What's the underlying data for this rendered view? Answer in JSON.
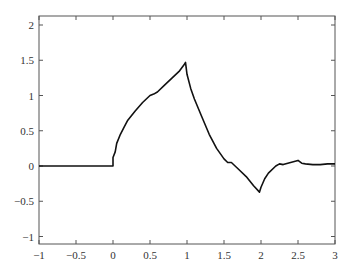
{
  "chart_data": {
    "type": "line",
    "title": "",
    "xlabel": "",
    "ylabel": "",
    "xlim": [
      -1,
      3
    ],
    "ylim": [
      -1.1,
      2.1
    ],
    "grid": false,
    "legend": null,
    "xticks": [
      "-1",
      "-0.5",
      "0",
      "0.5",
      "1",
      "1.5",
      "2",
      "2.5",
      "3"
    ],
    "yticks": [
      "-1",
      "-0.5",
      "0",
      "0.5",
      "1",
      "1.5",
      "2"
    ],
    "series": [
      {
        "name": "signal",
        "color": "#111111",
        "x": [
          -1,
          0,
          0.0,
          0.03,
          0.05,
          0.1,
          0.15,
          0.2,
          0.3,
          0.4,
          0.5,
          0.55,
          0.6,
          0.7,
          0.8,
          0.9,
          0.97,
          0.98,
          1.0,
          1.05,
          1.1,
          1.2,
          1.3,
          1.4,
          1.5,
          1.55,
          1.6,
          1.7,
          1.8,
          1.9,
          1.98,
          2.0,
          2.05,
          2.1,
          2.2,
          2.25,
          2.3,
          2.4,
          2.5,
          2.55,
          2.6,
          2.7,
          2.8,
          2.9,
          3.0
        ],
        "y": [
          0,
          0,
          0.12,
          0.2,
          0.32,
          0.45,
          0.55,
          0.65,
          0.78,
          0.9,
          1.0,
          1.02,
          1.05,
          1.15,
          1.25,
          1.35,
          1.45,
          1.47,
          1.3,
          1.1,
          0.95,
          0.7,
          0.45,
          0.25,
          0.1,
          0.05,
          0.05,
          -0.05,
          -0.15,
          -0.28,
          -0.37,
          -0.3,
          -0.18,
          -0.1,
          0.0,
          0.03,
          0.02,
          0.05,
          0.08,
          0.04,
          0.03,
          0.02,
          0.02,
          0.03,
          0.03
        ]
      }
    ]
  }
}
